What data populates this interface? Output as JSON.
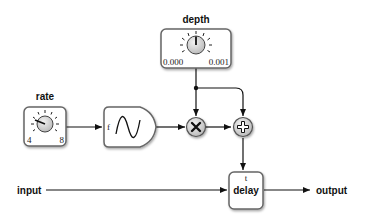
{
  "diagram": {
    "depth": {
      "label": "depth",
      "min": "0.000",
      "max": "0.001"
    },
    "rate": {
      "label": "rate",
      "min": "4",
      "max": "8"
    },
    "oscillator": {
      "input_label": "f",
      "shape": "sine-wave"
    },
    "multiply": {
      "symbol": "×",
      "icon": "multiply-icon"
    },
    "add": {
      "symbol": "+",
      "icon": "plus-icon"
    },
    "delay": {
      "label": "delay",
      "input_label": "t"
    },
    "input": {
      "label": "input"
    },
    "output": {
      "label": "output"
    }
  },
  "colors": {
    "line": "#111111",
    "box_border": "#666666",
    "box_fill": "#ffffff",
    "knob_fill": "#d8d8d8"
  }
}
